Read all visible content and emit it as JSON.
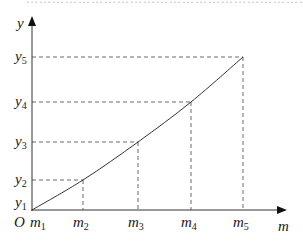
{
  "top_fragment": {
    "text": "…………………………………………………………………………………"
  },
  "chart_data": {
    "type": "line",
    "title": "",
    "xlabel": "m",
    "ylabel": "y",
    "origin_label": "O",
    "x_tick_labels": [
      "m1",
      "m2",
      "m3",
      "m4",
      "m5"
    ],
    "y_tick_labels": [
      "y1",
      "y2",
      "y3",
      "y4",
      "y5"
    ],
    "points": [
      {
        "x_label": "m1",
        "y_label": "y1",
        "px": 32,
        "py": 210
      },
      {
        "x_label": "m2",
        "y_label": "y2",
        "px": 83,
        "py": 180
      },
      {
        "x_label": "m3",
        "y_label": "y3",
        "px": 138,
        "py": 142
      },
      {
        "x_label": "m4",
        "y_label": "y4",
        "px": 191,
        "py": 102
      },
      {
        "x_label": "m5",
        "y_label": "y5",
        "px": 243,
        "py": 57
      }
    ],
    "curve": "smooth concave-up line through all points",
    "guides": "dashed lines from each point to both axes",
    "grid": false,
    "legend": null
  },
  "labels": {
    "y_axis": "y",
    "x_axis": "m",
    "origin": "O",
    "m_prefix": "m",
    "y_prefix": "y",
    "subs": [
      "1",
      "2",
      "3",
      "4",
      "5"
    ]
  }
}
